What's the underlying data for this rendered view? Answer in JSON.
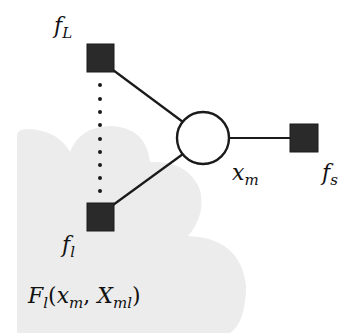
{
  "diagram": {
    "type": "factor-graph",
    "colors": {
      "cloud": "#ececec",
      "factor_fill": "#2a2a2a",
      "edge": "#1a1a1a",
      "variable_fill": "#ffffff",
      "text": "#111111"
    },
    "nodes": {
      "factor_top": {
        "label_base": "f",
        "label_sub": "L",
        "shape": "square"
      },
      "factor_bottom": {
        "label_base": "f",
        "label_sub": "l",
        "shape": "square"
      },
      "factor_right": {
        "label_base": "f",
        "label_sub": "s",
        "shape": "square"
      },
      "variable": {
        "label_base": "x",
        "label_sub": "m",
        "shape": "circle"
      }
    },
    "region": {
      "label_base": "F",
      "label_sub": "l",
      "label_open": "(",
      "arg1_base": "x",
      "arg1_sub": "m",
      "separator": ", ",
      "arg2_base": "X",
      "arg2_sub": "ml",
      "label_close": ")"
    },
    "edges": [
      {
        "from": "factor_top",
        "to": "variable",
        "style": "solid"
      },
      {
        "from": "factor_bottom",
        "to": "variable",
        "style": "solid"
      },
      {
        "from": "variable",
        "to": "factor_right",
        "style": "solid"
      },
      {
        "from": "factor_top",
        "to": "factor_bottom",
        "style": "dotted"
      }
    ]
  }
}
